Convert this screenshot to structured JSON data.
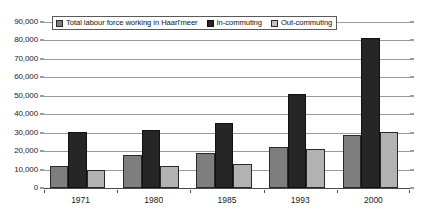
{
  "chart_data": {
    "type": "bar",
    "title": "",
    "subtitle": "",
    "xlabel": "",
    "ylabel": "",
    "categories": [
      "1971",
      "1980",
      "1985",
      "1993",
      "2000"
    ],
    "series": [
      {
        "name": "Total labour force working in Haarl'meer",
        "color": "#7e7e7e",
        "values": [
          12000,
          18000,
          19000,
          22000,
          28500
        ]
      },
      {
        "name": "In-commuting",
        "color": "#262626",
        "values": [
          30500,
          31500,
          35500,
          51000,
          81500
        ]
      },
      {
        "name": "Out-commuting",
        "color": "#b2b2b2",
        "values": [
          10000,
          12000,
          13000,
          21000,
          30500
        ]
      }
    ],
    "ylim": [
      0,
      90000
    ],
    "ytick_step": 10000,
    "ytick_labels": [
      "0",
      "10,000",
      "20,000",
      "30,000",
      "40,000",
      "50,000",
      "60,000",
      "70,000",
      "80,000",
      "90,000"
    ],
    "ytick_values": [
      0,
      10000,
      20000,
      30000,
      40000,
      50000,
      60000,
      70000,
      80000,
      90000
    ],
    "grid": true,
    "grid_axis": "y",
    "legend_position": "top-left-inside",
    "legend_border": true,
    "annotations": []
  },
  "legend": {
    "entries": [
      {
        "label": "Total labour force working in Haarl'meer",
        "swatch": "series-0-swatch"
      },
      {
        "label": "In-commuting",
        "swatch": "series-1-swatch"
      },
      {
        "label": "Out-commuting",
        "swatch": "series-2-swatch"
      }
    ]
  },
  "colors": {
    "series_0": "#7e7e7e",
    "series_1": "#262626",
    "series_2": "#b2b2b2",
    "gridline": "#9a9a9a",
    "axis": "#4a4a4a",
    "text": "#1a1a1a",
    "background": "#ffffff"
  }
}
